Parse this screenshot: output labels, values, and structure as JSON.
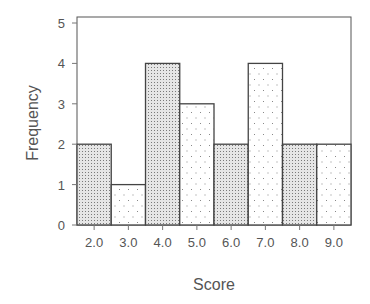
{
  "chart_data": {
    "type": "bar",
    "title": "",
    "xlabel": "Score",
    "ylabel": "Frequency",
    "categories": [
      "2.0",
      "3.0",
      "4.0",
      "5.0",
      "6.0",
      "7.0",
      "8.0",
      "9.0"
    ],
    "values": [
      2,
      1,
      4,
      3,
      2,
      4,
      2,
      2
    ],
    "ylim": [
      0,
      5
    ],
    "yticks": [
      "0",
      "1",
      "2",
      "3",
      "4",
      "5"
    ],
    "grid": false,
    "legend": null,
    "bar_patterns": [
      "dense-dots",
      "sparse-dots",
      "dense-dots",
      "sparse-dots",
      "dense-dots",
      "sparse-dots",
      "dense-dots",
      "sparse-dots"
    ]
  },
  "colors": {
    "frame": "#555555",
    "bar_outline": "#444444",
    "dense_fill": "#d9d9d9",
    "dot": "#777777",
    "text": "#555555"
  }
}
